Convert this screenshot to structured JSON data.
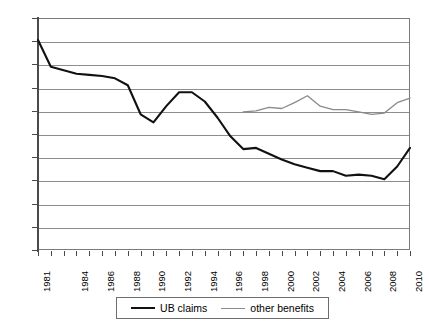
{
  "chart_data": {
    "type": "line",
    "title": "",
    "subtitle": "",
    "xlabel": "",
    "ylabel": "",
    "xlim": [
      1981,
      2010
    ],
    "ylim": [
      0,
      100
    ],
    "grid": true,
    "legend_position": "bottom",
    "y_ticks": [
      100,
      90,
      80,
      70,
      60,
      50,
      40,
      30,
      20,
      10,
      0
    ],
    "x_ticks": [
      1981,
      1982,
      1983,
      1984,
      1985,
      1986,
      1987,
      1988,
      1989,
      1990,
      1991,
      1992,
      1993,
      1994,
      1995,
      1996,
      1997,
      1998,
      1999,
      2000,
      2001,
      2002,
      2003,
      2004,
      2005,
      2006,
      2007,
      2008,
      2009,
      2010
    ],
    "x_tick_labels": [
      "1981",
      "",
      "",
      "1984",
      "",
      "1986",
      "",
      "1988",
      "",
      "1990",
      "",
      "1992",
      "",
      "1994",
      "",
      "1996",
      "",
      "1998",
      "",
      "2000",
      "",
      "2002",
      "",
      "2004",
      "",
      "2006",
      "",
      "2008",
      "",
      "2010"
    ],
    "x": [
      1981,
      1982,
      1983,
      1984,
      1985,
      1986,
      1987,
      1988,
      1989,
      1990,
      1991,
      1992,
      1993,
      1994,
      1995,
      1996,
      1997,
      1998,
      1999,
      2000,
      2001,
      2002,
      2003,
      2004,
      2005,
      2006,
      2007,
      2008,
      2009,
      2010
    ],
    "series": [
      {
        "name": "UB claims",
        "color": "#111111",
        "width": 2.1,
        "values": [
          90.5,
          79.0,
          77.5,
          76.0,
          75.5,
          75.0,
          74.0,
          71.0,
          58.5,
          55.0,
          62.0,
          68.0,
          68.0,
          64.0,
          57.0,
          49.0,
          43.5,
          44.0,
          41.5,
          39.0,
          37.0,
          35.5,
          34.0,
          34.0,
          32.0,
          32.5,
          32.0,
          30.5,
          36.0,
          44.0
        ]
      },
      {
        "name": "other benefits",
        "color": "#8a8a8a",
        "width": 1.3,
        "values": [
          null,
          null,
          null,
          null,
          null,
          null,
          null,
          null,
          null,
          null,
          null,
          null,
          null,
          null,
          null,
          null,
          59.5,
          60.0,
          61.5,
          61.0,
          63.5,
          66.5,
          62.0,
          60.5,
          60.5,
          59.5,
          58.5,
          59.0,
          63.5,
          65.5
        ]
      }
    ],
    "legend": [
      {
        "label": "UB claims",
        "swatch": "thick-black-line"
      },
      {
        "label": "other benefits",
        "swatch": "thin-gray-line"
      }
    ]
  }
}
